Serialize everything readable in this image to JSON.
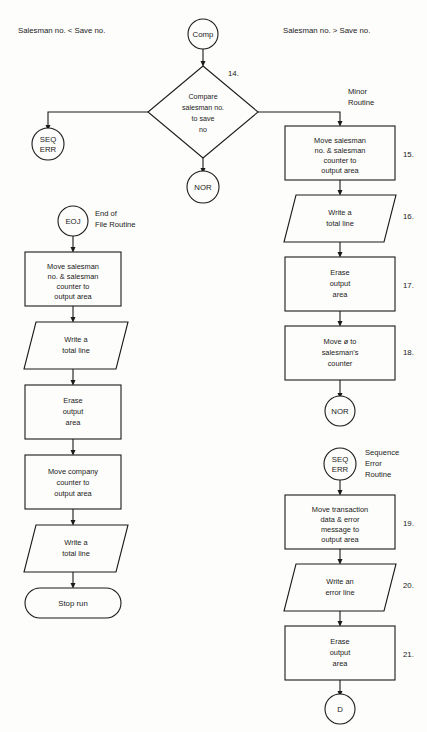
{
  "page": {
    "width": 427,
    "height": 732,
    "background": "#fdfdfb",
    "line_color": "#1a1a1a"
  },
  "headers": {
    "left": "Salesman no. < Save no.",
    "right": "Salesman no. > Save no."
  },
  "annotations": {
    "minor_routine": "Minor\nRoutine",
    "minor_routine_line1": "Minor",
    "minor_routine_line2": "Routine",
    "eoj_routine_line1": "End of",
    "eoj_routine_line2": "File Routine",
    "seq_err_routine_line1": "Sequence",
    "seq_err_routine_line2": "Error",
    "seq_err_routine_line3": "Routine"
  },
  "connectors": {
    "comp": "Comp",
    "nor_top": "NOR",
    "nor_right": "NOR",
    "seq_err_left_line1": "SEQ",
    "seq_err_left_line2": "ERR",
    "seq_err_right_line1": "SEQ",
    "seq_err_right_line2": "ERR",
    "eoj": "EOJ",
    "d": "D"
  },
  "decision": {
    "step": "14.",
    "line1": "Compare",
    "line2": "salesman no.",
    "line3": "to save",
    "line4": "no"
  },
  "minor_routine_steps": [
    {
      "step": "15.",
      "type": "process",
      "lines": [
        "Move salesman",
        "no. & salesman",
        "counter to",
        "output area"
      ]
    },
    {
      "step": "16.",
      "type": "io",
      "lines": [
        "Write a",
        "total line"
      ]
    },
    {
      "step": "17.",
      "type": "process",
      "lines": [
        "Erase",
        "output",
        "area"
      ]
    },
    {
      "step": "18.",
      "type": "process",
      "lines": [
        "Move ø to",
        "salesman's",
        "counter"
      ]
    }
  ],
  "sequence_error_steps": [
    {
      "step": "19.",
      "type": "process",
      "lines": [
        "Move transaction",
        "data & error",
        "message to",
        "output area"
      ]
    },
    {
      "step": "20.",
      "type": "io",
      "lines": [
        "Write an",
        "error line"
      ]
    },
    {
      "step": "21.",
      "type": "process",
      "lines": [
        "Erase",
        "output",
        "area"
      ]
    }
  ],
  "eoj_steps": [
    {
      "step": "",
      "type": "process",
      "lines": [
        "Move salesman",
        "no. & salesman",
        "counter to",
        "output area"
      ]
    },
    {
      "step": "",
      "type": "io",
      "lines": [
        "Write a",
        "total line"
      ]
    },
    {
      "step": "",
      "type": "process",
      "lines": [
        "Erase",
        "output",
        "area"
      ]
    },
    {
      "step": "",
      "type": "process",
      "lines": [
        "Move company",
        "counter to",
        "output area"
      ]
    },
    {
      "step": "",
      "type": "io",
      "lines": [
        "Write a",
        "total line"
      ]
    },
    {
      "step": "",
      "type": "terminator",
      "lines": [
        "Stop run"
      ]
    }
  ]
}
